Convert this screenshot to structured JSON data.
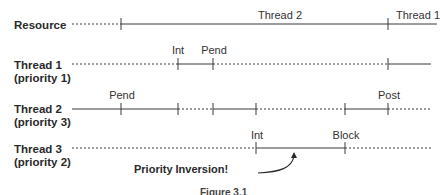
{
  "rows": [
    {
      "id": "resource",
      "label_line1": "Resource",
      "label_line2": ""
    },
    {
      "id": "thread1",
      "label_line1": "Thread 1",
      "label_line2": "(priority 1)"
    },
    {
      "id": "thread2",
      "label_line1": "Thread 2",
      "label_line2": "(priority 3)"
    },
    {
      "id": "thread3",
      "label_line1": "Thread 3",
      "label_line2": "(priority 2)"
    }
  ],
  "resource_labels": {
    "owner_a": "Thread 2",
    "owner_b": "Thread 1"
  },
  "events": {
    "thread1_int": "Int",
    "thread1_pend": "Pend",
    "thread2_pend": "Pend",
    "thread2_post": "Post",
    "thread3_int": "Int",
    "thread3_block": "Block"
  },
  "annotation": "Priority Inversion!",
  "caption": "Figure 3.1",
  "colors": {
    "line": "#3a3a3a",
    "text": "#2a2a2a",
    "background": "#ffffff"
  }
}
